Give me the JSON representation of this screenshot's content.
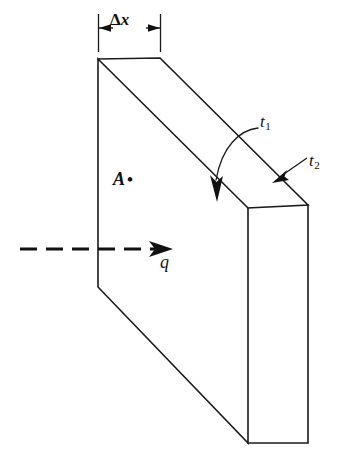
{
  "figure": {
    "labels": {
      "thickness_symbol": "Δ",
      "thickness_variable": "x",
      "area_label": "A",
      "area_marker": "•",
      "flux_label": "q",
      "surface_1_label": "t",
      "surface_1_subscript": "1",
      "surface_2_label": "t",
      "surface_2_subscript": "2"
    },
    "colors": {
      "stroke": "#1a1a1a",
      "fill": "#ffffff",
      "background": "#ffffff",
      "flux": "#111111"
    },
    "geometry": {
      "front_face": "98,59 248,208 248,443 98,287",
      "top_face": "98,59 160,58 308,205 248,208",
      "right_face": "248,208 308,205 308,443 248,443",
      "dimension_left_x": 98,
      "dimension_right_x": 160,
      "dimension_line_y": 28,
      "flux_line_y": 249,
      "flux_line_start_x": 20,
      "flux_line_end_x": 160
    }
  }
}
